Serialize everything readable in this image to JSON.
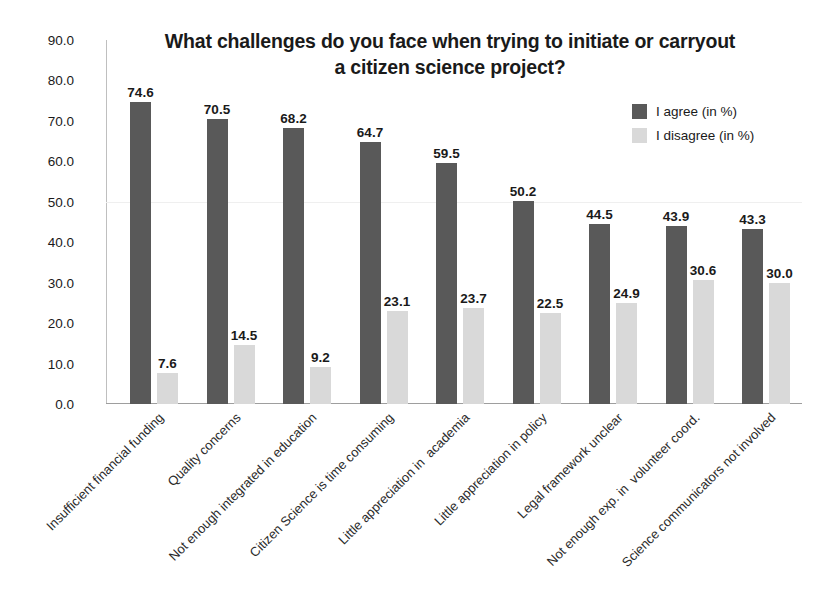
{
  "chart_data": {
    "type": "bar",
    "title": "What challenges do you face when trying to initiate or carryout a citizen science project?",
    "title_line1": "What challenges do you face when trying to initiate or carryout",
    "title_line2": "a citizen science project?",
    "xlabel": "",
    "ylabel": "",
    "ylim": [
      0,
      90
    ],
    "yticks": [
      "0.0",
      "10.0",
      "20.0",
      "30.0",
      "40.0",
      "50.0",
      "60.0",
      "70.0",
      "80.0",
      "90.0"
    ],
    "ytick_values": [
      0,
      10,
      20,
      30,
      40,
      50,
      60,
      70,
      80,
      90
    ],
    "grid": false,
    "legend_position": "top-right",
    "categories": [
      "Insufficient financial funding",
      "Quality concerns",
      "Not enough integrated in education",
      "Citizen Science is time consuming",
      "Little appreciation in  academia",
      "Little appreciation in policy",
      "Legal framework unclear",
      "Not enough exp. in  volunteer coord.",
      "Science communicators not involved"
    ],
    "series": [
      {
        "name": "I agree (in %)",
        "color": "#595959",
        "values": [
          74.6,
          70.5,
          68.2,
          64.7,
          59.5,
          50.2,
          44.5,
          43.9,
          43.3
        ],
        "labels": [
          "74.6",
          "70.5",
          "68.2",
          "64.7",
          "59.5",
          "50.2",
          "44.5",
          "43.9",
          "43.3"
        ]
      },
      {
        "name": "I disagree (in %)",
        "color": "#d9d9d9",
        "values": [
          7.6,
          14.5,
          9.2,
          23.1,
          23.7,
          22.5,
          24.9,
          30.6,
          30.0
        ],
        "labels": [
          "7.6",
          "14.5",
          "9.2",
          "23.1",
          "23.7",
          "22.5",
          "24.9",
          "30.6",
          "30.0"
        ]
      }
    ]
  }
}
